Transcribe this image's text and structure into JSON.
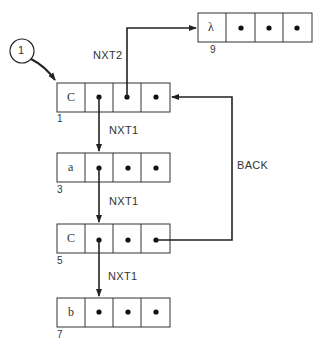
{
  "entry": {
    "label": "1"
  },
  "nodes": [
    {
      "id": "node-1",
      "head": "C",
      "index_label": "1"
    },
    {
      "id": "node-9",
      "head": "λ",
      "index_label": "9"
    },
    {
      "id": "node-3",
      "head": "a",
      "index_label": "3"
    },
    {
      "id": "node-5",
      "head": "C",
      "index_label": "5"
    },
    {
      "id": "node-7",
      "head": "b",
      "index_label": "7"
    }
  ],
  "edges": [
    {
      "from": "node-1",
      "to": "node-9",
      "label": "NXT2"
    },
    {
      "from": "node-1",
      "to": "node-3",
      "label": "NXT1"
    },
    {
      "from": "node-3",
      "to": "node-5",
      "label": "NXT1"
    },
    {
      "from": "node-5",
      "to": "node-7",
      "label": "NXT1"
    },
    {
      "from": "node-5",
      "to": "node-1",
      "label": "BACK"
    }
  ],
  "colors": {
    "line": "#222222",
    "text": "#333333",
    "background": "#ffffff"
  }
}
